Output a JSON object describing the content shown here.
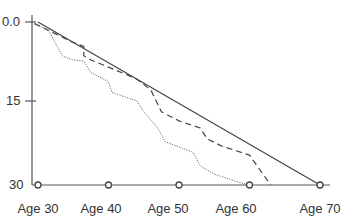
{
  "chart_data": {
    "type": "line",
    "title": "",
    "xlabel": "",
    "ylabel": "",
    "x_tick_labels": [
      "Age 30",
      "Age 40",
      "Age 50",
      "Age 60",
      "Age 70"
    ],
    "x_ticks": [
      30,
      40,
      50,
      60,
      70
    ],
    "y_tick_labels": [
      "0.0",
      "15",
      "30"
    ],
    "y_ticks": [
      0,
      15,
      30
    ],
    "ylim": [
      0,
      30
    ],
    "y_inverted": true,
    "xlim": [
      29,
      70
    ],
    "grid": false,
    "legend": null,
    "series": [
      {
        "name": "solid",
        "style": "solid",
        "x": [
          30,
          70
        ],
        "y": [
          0,
          30
        ]
      },
      {
        "name": "dashed",
        "style": "dashed",
        "x": [
          29.5,
          33,
          34.5,
          36.5,
          36.5,
          37.5,
          40,
          44,
          46,
          47.5,
          50,
          53,
          54,
          56,
          60,
          63
        ],
        "y": [
          0.3,
          2.5,
          3.5,
          4.5,
          6.2,
          7.0,
          8.3,
          10.5,
          12.5,
          16.5,
          18.2,
          19.5,
          21.5,
          22.8,
          24.5,
          30
        ]
      },
      {
        "name": "dotted",
        "style": "dotted",
        "x": [
          29.5,
          31.5,
          32.5,
          33.5,
          35,
          36.5,
          37.5,
          40,
          40.5,
          44,
          45,
          47,
          48,
          52,
          53,
          55,
          58,
          60
        ],
        "y": [
          0.3,
          1.5,
          4,
          6.3,
          7,
          7.2,
          9.3,
          11,
          13,
          14.5,
          16.5,
          19.5,
          22,
          24,
          26.5,
          28,
          29.3,
          30
        ]
      }
    ],
    "markers": [
      {
        "x": 30,
        "y": 30
      },
      {
        "x": 40,
        "y": 30
      },
      {
        "x": 50,
        "y": 30
      },
      {
        "x": 60,
        "y": 30
      },
      {
        "x": 70,
        "y": 30
      }
    ]
  }
}
